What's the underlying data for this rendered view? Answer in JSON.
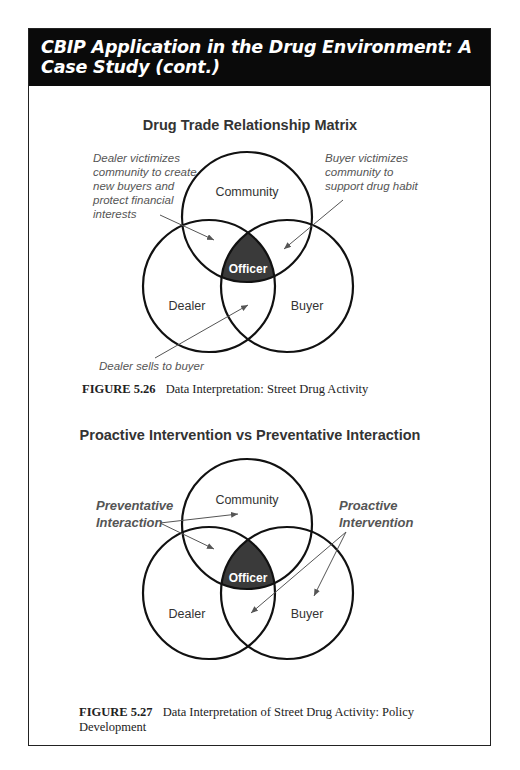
{
  "header": {
    "title": "CBIP Application in the Drug Environment: A Case Study (cont.)"
  },
  "figures": [
    {
      "title": "Drug Trade Relationship Matrix",
      "circles": {
        "top": "Community",
        "left": "Dealer",
        "right": "Buyer",
        "center": "Officer"
      },
      "annotations": {
        "dealer_victimizes": [
          "Dealer victimizes",
          "community to create",
          "new buyers and",
          "protect financial",
          "interests"
        ],
        "buyer_victimizes": [
          "Buyer victimizes",
          "community to",
          "support drug habit"
        ],
        "dealer_sells": "Dealer sells to buyer"
      },
      "caption_number": "FIGURE 5.26",
      "caption_text": "Data Interpretation: Street Drug Activity"
    },
    {
      "title": "Proactive Intervention vs Preventative Interaction",
      "circles": {
        "top": "Community",
        "left": "Dealer",
        "right": "Buyer",
        "center": "Officer"
      },
      "annotations": {
        "preventative": [
          "Preventative",
          "Interaction"
        ],
        "proactive": [
          "Proactive",
          "Intervention"
        ]
      },
      "caption_number": "FIGURE 5.27",
      "caption_text": "Data Interpretation of Street Drug Activity: Policy",
      "caption_text_line2": "Development"
    }
  ],
  "colors": {
    "header_bg": "#0a0a0a",
    "officer_fill": "#3a3a3a",
    "annotation_text": "#555555",
    "circle_stroke": "#111111"
  }
}
